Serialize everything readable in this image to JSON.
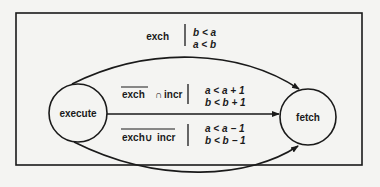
{
  "diagram": {
    "nodes": [
      {
        "id": "execute",
        "label": "execute"
      },
      {
        "id": "fetch",
        "label": "fetch"
      }
    ],
    "edges": [
      {
        "from": "execute",
        "to": "fetch",
        "route": "top",
        "guard": "exch",
        "actions": [
          "b < a",
          "a < b"
        ]
      },
      {
        "from": "execute",
        "to": "fetch",
        "route": "middle",
        "guard": {
          "negated": "exch",
          "op": "∩",
          "term": "incr"
        },
        "actions": [
          "a < a + 1",
          "b < b + 1"
        ]
      },
      {
        "from": "execute",
        "to": "fetch",
        "route": "bottom",
        "guard": {
          "negated_all": "exch ∪ incr",
          "left": "exch",
          "op": "∪",
          "right": "incr"
        },
        "actions": [
          "a < a − 1",
          "b < b − 1"
        ]
      }
    ],
    "colors": {
      "stroke": "#1a1a1a",
      "background": "#f4f4f2"
    }
  }
}
